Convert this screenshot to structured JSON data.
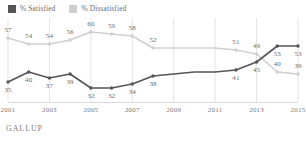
{
  "legend": {
    "position": "top-left",
    "items": [
      {
        "label": "% Satisfied",
        "color": "#555558",
        "icon": "square-swatch"
      },
      {
        "label": "% Dissatisfied",
        "color": "#cfcfcf",
        "icon": "square-swatch"
      }
    ]
  },
  "footer": {
    "source": "GALLUP"
  },
  "colors": {
    "satisfied": "#555558",
    "dissatisfied": "#cfcfcf",
    "gridline": "#e3e3e3",
    "baseline": "#d8d8d8",
    "text": "#6b6c6e"
  },
  "chart_data": {
    "type": "line",
    "title": "",
    "subtitle": "",
    "xlabel": "",
    "ylabel": "",
    "grid": "vertical-only",
    "legend_position": "top-left",
    "source": "GALLUP",
    "x": [
      2001,
      2002,
      2003,
      2004,
      2005,
      2006,
      2007,
      2008,
      2009,
      2010,
      2011,
      2012,
      2013,
      2014,
      2015
    ],
    "xtick_labels": [
      "2001",
      "2003",
      "2005",
      "2007",
      "2009",
      "2011",
      "2013",
      "2015"
    ],
    "xticks": [
      2001,
      2003,
      2005,
      2007,
      2009,
      2011,
      2013,
      2015
    ],
    "xlim": [
      2001,
      2015
    ],
    "ylim": [
      25,
      65
    ],
    "series": [
      {
        "name": "% Dissatisfied",
        "color": "#cfcfcf",
        "values": [
          57,
          54,
          54,
          56,
          60,
          59,
          58,
          52,
          52,
          52,
          52,
          51,
          49,
          40,
          39
        ],
        "labels": [
          "57",
          "54",
          "54",
          "56",
          "60",
          "59",
          "58",
          "52",
          "",
          "",
          "",
          "51",
          "49",
          "40",
          "39"
        ]
      },
      {
        "name": "% Satisfied",
        "color": "#555558",
        "values": [
          35,
          40,
          37,
          39,
          32,
          32,
          34,
          38,
          39,
          40,
          40,
          41,
          45,
          53,
          53
        ],
        "labels": [
          "35",
          "40",
          "37",
          "39",
          "32",
          "32",
          "34",
          "38",
          "",
          "",
          "",
          "41",
          "45",
          "53",
          "53"
        ]
      }
    ]
  }
}
